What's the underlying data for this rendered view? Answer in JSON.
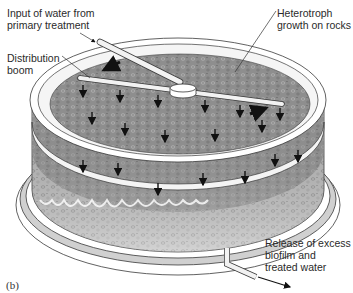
{
  "figure": {
    "panel_label": "(b)",
    "labels": {
      "input": "Input of water from\nprimary treatment",
      "boom": "Distribution\nboom",
      "heterotroph": "Heterotroph\ngrowth on rocks",
      "release": "Release of excess\nbiofilm and\ntreated water"
    },
    "icons": [
      "arrow-down-icon",
      "rotation-arrow-icon",
      "outflow-arrow-icon"
    ],
    "colors": {
      "rock_bed": "#8c8c8c",
      "rock_bed_light": "#c8c8c8",
      "outline": "#3a3a3a",
      "pipe": "#f2f2f2",
      "arrow": "#111111"
    }
  }
}
